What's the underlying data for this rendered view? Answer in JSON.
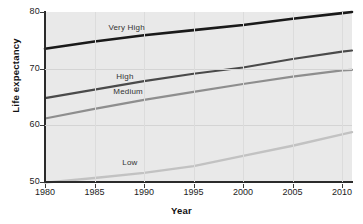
{
  "chart_data": {
    "type": "line",
    "title": "",
    "xlabel": "Year",
    "ylabel": "Life expectancy",
    "xlim": [
      1980,
      2011
    ],
    "ylim": [
      50,
      80
    ],
    "grid": true,
    "legend_position": "inline-labels",
    "x_ticks": [
      "1980",
      "1985",
      "1990",
      "1995",
      "2000",
      "2005",
      "2010"
    ],
    "y_ticks": [
      "50",
      "60",
      "70",
      "80"
    ],
    "x": [
      1980,
      1985,
      1990,
      1995,
      2000,
      2005,
      2010,
      2011
    ],
    "series": [
      {
        "name": "Very High",
        "color": "#1a1a1a",
        "width": 2.6,
        "values": [
          73.5,
          74.8,
          75.9,
          76.8,
          77.7,
          78.8,
          79.8,
          80.0
        ]
      },
      {
        "name": "High",
        "color": "#4a4a4a",
        "width": 2.2,
        "values": [
          64.8,
          66.3,
          67.8,
          69.1,
          70.2,
          71.7,
          73.0,
          73.2
        ]
      },
      {
        "name": "Medium",
        "color": "#8e8e8e",
        "width": 2.2,
        "values": [
          61.2,
          62.9,
          64.5,
          65.9,
          67.3,
          68.6,
          69.7,
          69.8
        ]
      },
      {
        "name": "Low",
        "color": "#c2c2c2",
        "width": 2.4,
        "values": [
          49.9,
          50.7,
          51.6,
          52.8,
          54.6,
          56.4,
          58.4,
          58.8
        ]
      }
    ],
    "annotations": [
      {
        "text": "Very High",
        "x": 1986.4,
        "y": 77.2
      },
      {
        "text": "High",
        "x": 1987.2,
        "y": 68.6
      },
      {
        "text": "Medium",
        "x": 1986.9,
        "y": 65.8
      },
      {
        "text": "Low",
        "x": 1987.8,
        "y": 53.3
      }
    ]
  }
}
